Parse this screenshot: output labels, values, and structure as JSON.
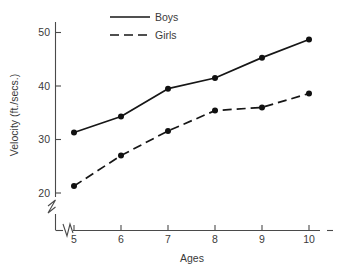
{
  "chart_data": {
    "type": "line",
    "title": "",
    "xlabel": "Ages",
    "ylabel": "Velocity (ft./secs.)",
    "categories": [
      5,
      6,
      7,
      8,
      9,
      10
    ],
    "x": [
      5,
      6,
      7,
      8,
      9,
      10
    ],
    "xticklabels": [
      "5",
      "6",
      "7",
      "8",
      "9",
      "10"
    ],
    "yticklabels": [
      "20",
      "30",
      "40",
      "50"
    ],
    "yticks": [
      20,
      30,
      40,
      50
    ],
    "xlim": [
      5,
      10
    ],
    "ylim": [
      18,
      52
    ],
    "grid": false,
    "legend_position": "top-center",
    "axis_break_x": true,
    "axis_break_y": true,
    "series": [
      {
        "name": "Boys",
        "style": "solid",
        "marker": "filled-circle",
        "color": "#161616",
        "values": [
          31.3,
          34.3,
          39.5,
          41.5,
          45.3,
          48.7
        ]
      },
      {
        "name": "Girls",
        "style": "dashed",
        "marker": "filled-circle",
        "color": "#161616",
        "values": [
          21.3,
          27.0,
          31.6,
          35.4,
          36.0,
          38.6
        ]
      }
    ]
  },
  "legend": {
    "items": [
      {
        "label": "Boys",
        "style": "solid"
      },
      {
        "label": "Girls",
        "style": "dashed"
      }
    ]
  },
  "axes": {
    "y_title": "Velocity (ft./secs.)",
    "x_title": "Ages"
  }
}
